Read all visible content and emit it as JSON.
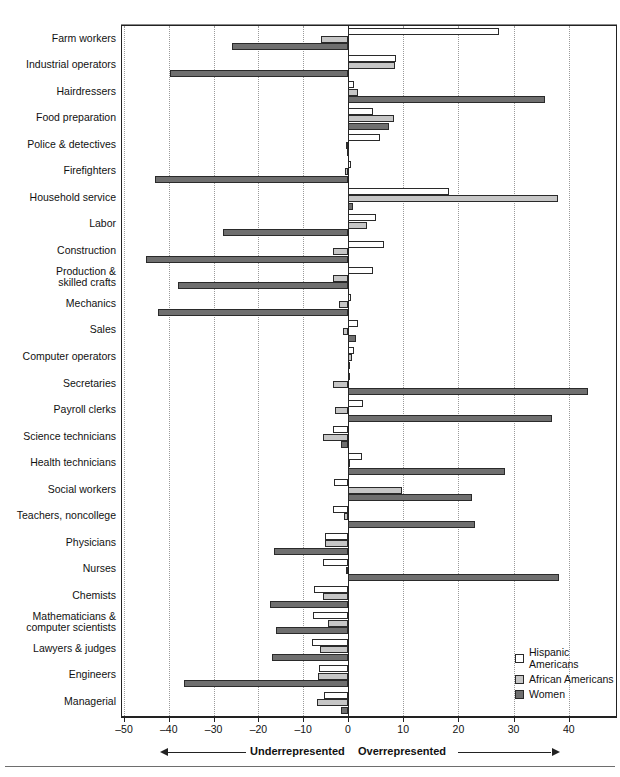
{
  "chart_data": {
    "type": "bar",
    "orientation": "horizontal",
    "title": "",
    "subtitle": "",
    "xlabel": "",
    "ylabel": "",
    "xlim": [
      -50,
      45
    ],
    "xticks": [
      -50,
      -40,
      -30,
      -20,
      -10,
      0,
      10,
      20,
      30,
      40
    ],
    "xticklabels": [
      "–50",
      "–40",
      "–30",
      "–20",
      "–10",
      "0",
      "10",
      "20",
      "30",
      "40"
    ],
    "grid": "vertical-dotted",
    "legend_position": "bottom-right",
    "annotations": {
      "left_direction": "Underrepresented",
      "right_direction": "Overrepresented"
    },
    "categories": [
      "Farm workers",
      "Industrial operators",
      "Hairdressers",
      "Food preparation",
      "Police & detectives",
      "Firefighters",
      "Household service",
      "Labor",
      "Construction",
      "Production &\nskilled crafts",
      "Mechanics",
      "Sales",
      "Computer operators",
      "Secretaries",
      "Payroll clerks",
      "Science technicians",
      "Health technicians",
      "Social workers",
      "Teachers, noncollege",
      "Physicians",
      "Nurses",
      "Chemists",
      "Mathematicians &\ncomputer scientists",
      "Lawyers & judges",
      "Engineers",
      "Managerial"
    ],
    "series": [
      {
        "name": "Hispanic Americans",
        "color": "#ffffff",
        "values": [
          27.4,
          8.7,
          1.0,
          4.5,
          5.8,
          0.6,
          18.3,
          5.0,
          6.5,
          4.5,
          0.5,
          1.9,
          1.0,
          0.0,
          2.8,
          -3.4,
          2.5,
          -3.1,
          -3.4,
          -5.2,
          -5.5,
          -7.5,
          -7.8,
          -8.0,
          -6.5,
          -5.3
        ]
      },
      {
        "name": "African Americans",
        "color": "#c6c6c6",
        "values": [
          -6.0,
          8.6,
          1.9,
          8.4,
          -0.5,
          -0.6,
          38.0,
          3.4,
          -3.3,
          -3.4,
          -2.0,
          -1.1,
          0.7,
          -3.3,
          -2.9,
          -5.5,
          0.0,
          9.8,
          -1.0,
          -5.2,
          -0.5,
          -5.5,
          -4.5,
          -6.3,
          -6.8,
          -7.0
        ]
      },
      {
        "name": "Women",
        "color": "#6f6f6f",
        "values": [
          -25.9,
          -39.8,
          35.6,
          7.4,
          -0.2,
          -43.0,
          0.9,
          -28.0,
          -45.0,
          -38.0,
          -42.5,
          1.4,
          0.4,
          43.4,
          37.0,
          -1.5,
          28.5,
          22.5,
          23.0,
          -16.5,
          38.2,
          -17.5,
          -16.0,
          -17.0,
          -36.5,
          -1.6
        ]
      }
    ]
  },
  "legend": {
    "items": [
      {
        "label": "Hispanic Americans",
        "swatch": "s0"
      },
      {
        "label": "African Americans",
        "swatch": "s1"
      },
      {
        "label": "Women",
        "swatch": "s2"
      }
    ]
  }
}
